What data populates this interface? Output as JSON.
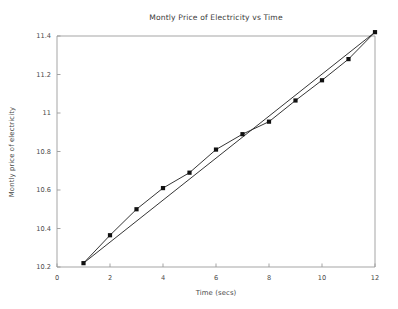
{
  "figure": {
    "background_color": "#ffffff",
    "line_color": "#2a2a2a",
    "marker_color": "#111111",
    "axis_color": "#9b9b9b",
    "text_color": "#3b3b3b"
  },
  "chart_data": {
    "type": "line",
    "title": "Montly Price of Electricity vs Time",
    "xlabel": "Time (secs)",
    "ylabel": "Montly price of electricity",
    "xlim": [
      0,
      12
    ],
    "ylim": [
      10.2,
      11.4
    ],
    "xticks": [
      0,
      2,
      4,
      6,
      8,
      10,
      12
    ],
    "xtick_labels": [
      "0",
      "2",
      "4",
      "6",
      "8",
      "10",
      "12"
    ],
    "yticks": [
      10.2,
      10.4,
      10.6,
      10.8,
      11.0,
      11.2,
      11.4
    ],
    "ytick_labels": [
      "10.2",
      "10.4",
      "10.6",
      "10.8",
      "11",
      "11.2",
      "11.4"
    ],
    "grid": false,
    "legend": null,
    "x": [
      1,
      2,
      3,
      4,
      5,
      6,
      7,
      8,
      9,
      10,
      11,
      12
    ],
    "series": [
      {
        "name": "data",
        "marker": "square",
        "values": [
          10.22,
          10.365,
          10.5,
          10.61,
          10.69,
          10.81,
          10.89,
          10.955,
          11.065,
          11.17,
          11.28,
          11.42
        ]
      },
      {
        "name": "fit",
        "marker": "none",
        "values": [
          10.22,
          10.329,
          10.438,
          10.547,
          10.656,
          10.765,
          10.875,
          10.984,
          11.093,
          11.202,
          11.311,
          11.42
        ]
      }
    ]
  }
}
